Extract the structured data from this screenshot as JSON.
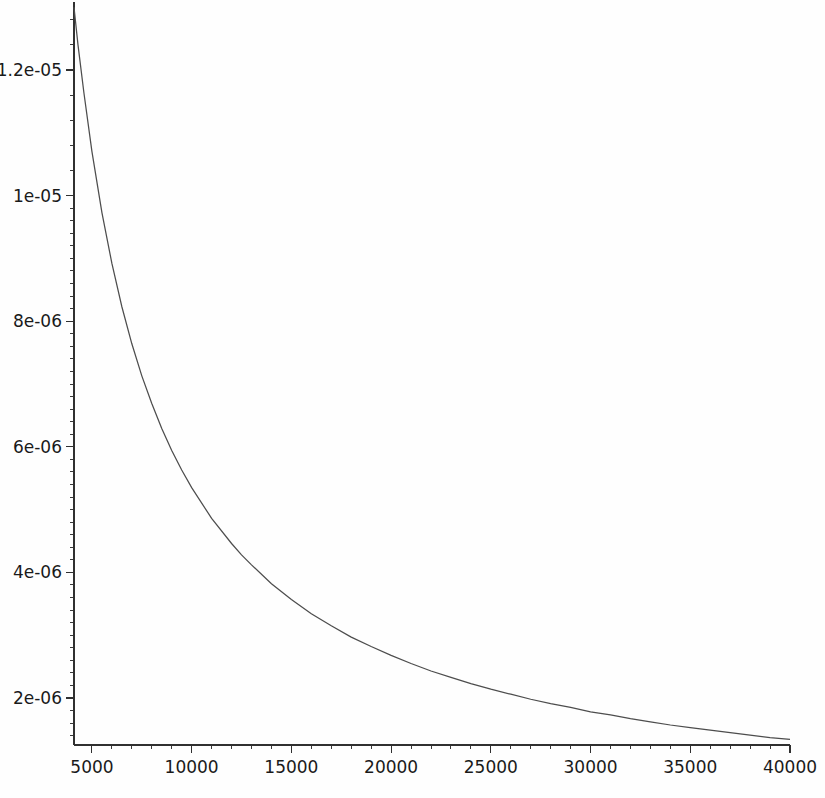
{
  "chart_data": {
    "type": "line",
    "title": "",
    "subtitle": "",
    "xlabel": "",
    "ylabel": "",
    "xlim": [
      4100,
      40000
    ],
    "ylim": [
      1.2e-06,
      1.32e-05
    ],
    "grid": false,
    "legend": null,
    "legend_position": "none",
    "series": [
      {
        "name": "curve",
        "color": "#4d4d4d",
        "x": [
          4100,
          4300,
          4600,
          5000,
          5500,
          6000,
          6500,
          7000,
          7500,
          8000,
          8500,
          9000,
          9500,
          10000,
          11000,
          12000,
          12500,
          13000,
          14000,
          15000,
          16000,
          17000,
          18000,
          19000,
          20000,
          21000,
          22000,
          23000,
          24000,
          25000,
          26000,
          27000,
          28000,
          29000,
          30000,
          31000,
          32000,
          33000,
          34000,
          35000,
          36000,
          37000,
          38000,
          39000,
          40000
        ],
        "y": [
          1.3e-05,
          1.24e-05,
          1.163e-05,
          1.07e-05,
          9.73e-06,
          8.92e-06,
          8.23e-06,
          7.64e-06,
          7.13e-06,
          6.69e-06,
          6.29e-06,
          5.94e-06,
          5.63e-06,
          5.35e-06,
          4.86e-06,
          4.46e-06,
          4.28e-06,
          4.12e-06,
          3.82e-06,
          3.57e-06,
          3.34e-06,
          3.15e-06,
          2.97e-06,
          2.82e-06,
          2.68e-06,
          2.55e-06,
          2.43e-06,
          2.33e-06,
          2.23e-06,
          2.14e-06,
          2.06e-06,
          1.98e-06,
          1.91e-06,
          1.85e-06,
          1.78e-06,
          1.73e-06,
          1.67e-06,
          1.62e-06,
          1.57e-06,
          1.53e-06,
          1.49e-06,
          1.45e-06,
          1.41e-06,
          1.37e-06,
          1.34e-06
        ]
      }
    ],
    "x_ticks": [
      {
        "value": 5000,
        "label": "5000"
      },
      {
        "value": 10000,
        "label": "10000"
      },
      {
        "value": 15000,
        "label": "15000"
      },
      {
        "value": 20000,
        "label": "20000"
      },
      {
        "value": 25000,
        "label": "25000"
      },
      {
        "value": 30000,
        "label": "30000"
      },
      {
        "value": 35000,
        "label": "35000"
      },
      {
        "value": 40000,
        "label": "40000"
      }
    ],
    "x_minor_ticks": [
      6000,
      7000,
      8000,
      9000,
      11000,
      12000,
      13000,
      14000,
      16000,
      17000,
      18000,
      19000,
      21000,
      22000,
      23000,
      24000,
      26000,
      27000,
      28000,
      29000,
      31000,
      32000,
      33000,
      34000,
      36000,
      37000,
      38000,
      39000
    ],
    "y_ticks": [
      {
        "value": 2e-06,
        "label": "2e-06"
      },
      {
        "value": 4e-06,
        "label": "4e-06"
      },
      {
        "value": 6e-06,
        "label": "6e-06"
      },
      {
        "value": 8e-06,
        "label": "8e-06"
      },
      {
        "value": 1e-05,
        "label": "1e-05"
      },
      {
        "value": 1.2e-05,
        "label": "1.2e-05"
      }
    ],
    "y_minor_ticks": [
      1.4e-06,
      1.6e-06,
      1.8e-06,
      2.2e-06,
      2.4e-06,
      2.6e-06,
      2.8e-06,
      3e-06,
      3.2e-06,
      3.4e-06,
      3.6e-06,
      3.8e-06,
      4.2e-06,
      4.4e-06,
      4.6e-06,
      4.8e-06,
      5e-06,
      5.2e-06,
      5.4e-06,
      5.6e-06,
      5.8e-06,
      6.2e-06,
      6.4e-06,
      6.6e-06,
      6.8e-06,
      7e-06,
      7.2e-06,
      7.4e-06,
      7.6e-06,
      7.8e-06,
      8.2e-06,
      8.4e-06,
      8.6e-06,
      8.8e-06,
      9e-06,
      9.2e-06,
      9.4e-06,
      9.6e-06,
      9.8e-06,
      1.04e-05,
      1.08e-05,
      1.12e-05,
      1.16e-05,
      1.24e-05,
      1.28e-05,
      1.32e-05
    ]
  },
  "colors": {
    "axis": "#303030",
    "curve": "#4d4d4d",
    "background": "#fefefe",
    "text": "#1a1a1a"
  }
}
